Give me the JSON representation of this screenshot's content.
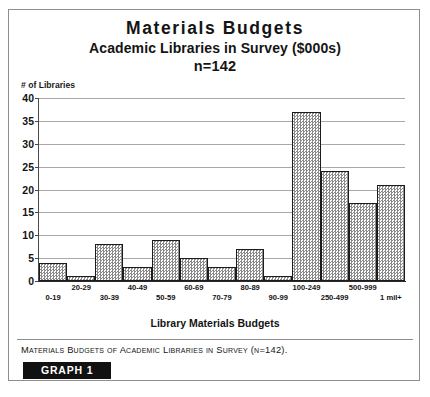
{
  "title": {
    "main": "Materials Budgets",
    "subtitle": "Academic Libraries in Survey ($000s)",
    "sample": "n=142"
  },
  "axes": {
    "y_title": "# of Libraries",
    "x_title": "Library Materials Budgets"
  },
  "caption": {
    "text": "Materials Budgets of Academic Libraries in Survey (n=142).",
    "tag": "GRAPH 1"
  },
  "chart_data": {
    "type": "bar",
    "title": "Materials Budgets",
    "subtitle": "Academic Libraries in Survey ($000s)",
    "annotation": "n=142",
    "xlabel": "Library Materials Budgets",
    "ylabel": "# of Libraries",
    "ylim": [
      0,
      40
    ],
    "yticks": [
      0,
      5,
      10,
      15,
      20,
      25,
      30,
      35,
      40
    ],
    "grid": true,
    "legend": "none",
    "bar_fill": "#8a8a8a",
    "bar_fill_style": "50% checkered dither",
    "bar_edge": "#1c1c1c",
    "categories": [
      "0-19",
      "20-29",
      "30-39",
      "40-49",
      "50-59",
      "60-69",
      "70-79",
      "80-89",
      "90-99",
      "100-249",
      "250-499",
      "500-999",
      "1 mil+"
    ],
    "values": [
      4,
      1,
      8,
      3,
      9,
      5,
      3,
      7,
      1,
      37,
      24,
      17,
      21
    ],
    "total": 142
  }
}
